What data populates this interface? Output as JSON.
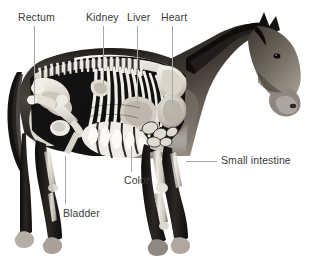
{
  "figure": {
    "illustration_name": "horse-anatomy-skeleton-organs",
    "background_color": "#ffffff",
    "label_color": "#3a3a3a",
    "leader_color": "#a8a8a8"
  },
  "labels": [
    {
      "id": "rectum",
      "text": "Rectum"
    },
    {
      "id": "kidney",
      "text": "Kidney"
    },
    {
      "id": "liver",
      "text": "Liver"
    },
    {
      "id": "heart",
      "text": "Heart"
    },
    {
      "id": "small_intestine",
      "text": "Small intestine"
    },
    {
      "id": "colon",
      "text": "Colon"
    },
    {
      "id": "bladder",
      "text": "Bladder"
    }
  ]
}
